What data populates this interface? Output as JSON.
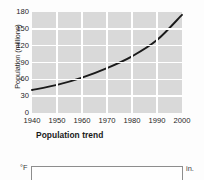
{
  "page": {
    "background_color": "#fdfdfd"
  },
  "figure_population": {
    "caption": "Population trend",
    "plot_background_color": "#d9d9d9",
    "gridline_color": "#ffffff",
    "line_color": "#1a1a1a"
  },
  "figure_climate": {
    "left_axis_label": "°F",
    "right_axis_label": "in.",
    "frame_color": "#8d8d8d"
  },
  "chart_data": {
    "type": "line",
    "title": "Population trend",
    "xlabel": "",
    "ylabel": "Population (millions)",
    "x": [
      1940,
      1950,
      1960,
      1970,
      1980,
      1990,
      2000
    ],
    "xtick_labels": [
      "1940",
      "1950",
      "1960",
      "1970",
      "1980",
      "1990",
      "2000"
    ],
    "ytick_labels": [
      "0",
      "30",
      "60",
      "90",
      "120",
      "150",
      "180"
    ],
    "yticks": [
      0,
      30,
      60,
      90,
      120,
      150,
      180
    ],
    "xlim": [
      1940,
      2000
    ],
    "ylim": [
      0,
      180
    ],
    "grid": true,
    "legend": false,
    "series": [
      {
        "name": "Population",
        "values": [
          41,
          50,
          63,
          80,
          101,
          130,
          175
        ]
      }
    ]
  }
}
